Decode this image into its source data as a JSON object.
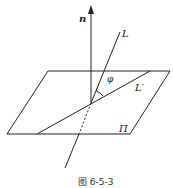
{
  "figure": {
    "caption": "图 6-5-3",
    "labels": {
      "normal": "n",
      "line": "L",
      "projection": "L′",
      "angle": "φ",
      "plane": "Π"
    },
    "colors": {
      "stroke": "#222222",
      "background": "#ffffff"
    }
  }
}
